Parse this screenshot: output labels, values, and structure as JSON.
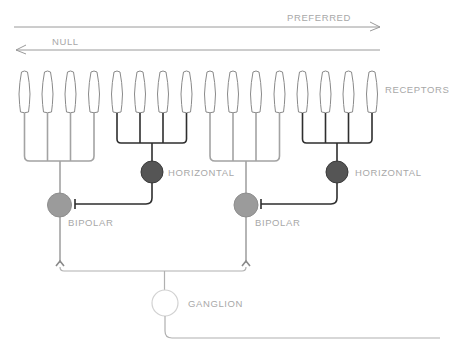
{
  "diagram": {
    "directions": {
      "preferred": {
        "label": "PREFERRED",
        "direction": "right"
      },
      "null": {
        "label": "NULL",
        "direction": "left"
      }
    },
    "labels": {
      "receptors": "RECEPTORS",
      "horizontal_1": "HORIZONTAL",
      "horizontal_2": "HORIZONTAL",
      "bipolar_1": "BIPOLAR",
      "bipolar_2": "BIPOLAR",
      "ganglion": "GANGLION"
    },
    "receptor_count": 16,
    "groups": [
      {
        "cell": "bipolar",
        "receptors": [
          1,
          2,
          3,
          4
        ]
      },
      {
        "cell": "horizontal",
        "receptors": [
          5,
          6,
          7,
          8
        ],
        "inhibits": "bipolar_1"
      },
      {
        "cell": "bipolar",
        "receptors": [
          9,
          10,
          11,
          12
        ]
      },
      {
        "cell": "horizontal",
        "receptors": [
          13,
          14,
          15,
          16
        ],
        "inhibits": "bipolar_2"
      }
    ],
    "colors": {
      "bipolar_fill": "#9b9b9b",
      "horizontal_fill": "#555555",
      "ganglion_fill": "#ffffff",
      "bipolar_lines": "#a3a3a3",
      "horizontal_lines": "#2e2e2e",
      "label_text": "#a8a8a8"
    }
  }
}
